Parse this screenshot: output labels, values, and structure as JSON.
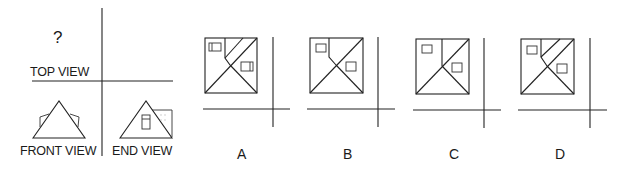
{
  "question": {
    "unknown_marker": "?",
    "views": {
      "top_label": "TOP VIEW",
      "front_label": "FRONT VIEW",
      "end_label": "END VIEW"
    }
  },
  "options": [
    {
      "id": "A",
      "label": "A",
      "description": "Hip roof top view with two skylights; ridge line plus double dormer lines"
    },
    {
      "id": "B",
      "label": "B",
      "description": "Hip roof top view with two skylights; single ridge bend"
    },
    {
      "id": "C",
      "label": "C",
      "description": "Hip roof top view with two skylights; vertical ridge line"
    },
    {
      "id": "D",
      "label": "D",
      "description": "Hip roof top view with two skylights; double parallel dormer lines"
    }
  ]
}
